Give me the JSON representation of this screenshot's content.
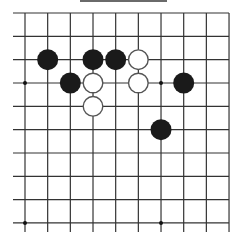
{
  "board": {
    "columns": 10,
    "rows": 10,
    "origin": {
      "x": 25,
      "y": 13
    },
    "spacing": {
      "x": 22.67,
      "y": 23.33
    },
    "line_color": "#333333",
    "left_overhang": 12,
    "bottom_overhang": 9,
    "stone_radius": 10.5,
    "star_points": [
      {
        "col": 0,
        "row": 3
      },
      {
        "col": 6,
        "row": 3
      },
      {
        "col": 0,
        "row": 9
      },
      {
        "col": 6,
        "row": 9
      }
    ],
    "stones": [
      {
        "color": "black",
        "col": 1,
        "row": 2
      },
      {
        "color": "black",
        "col": 3,
        "row": 2
      },
      {
        "color": "black",
        "col": 4,
        "row": 2
      },
      {
        "color": "white",
        "col": 5,
        "row": 2
      },
      {
        "color": "black",
        "col": 2,
        "row": 3
      },
      {
        "color": "white",
        "col": 3,
        "row": 3
      },
      {
        "color": "white",
        "col": 5,
        "row": 3
      },
      {
        "color": "black",
        "col": 7,
        "row": 3
      },
      {
        "color": "white",
        "col": 3,
        "row": 4
      },
      {
        "color": "black",
        "col": 6,
        "row": 5
      }
    ],
    "colors": {
      "black_stone": "#1a1a1a",
      "white_stone_fill": "#ffffff",
      "white_stone_stroke": "#555555"
    }
  },
  "caption": {
    "visible": "partial-cut-off"
  }
}
